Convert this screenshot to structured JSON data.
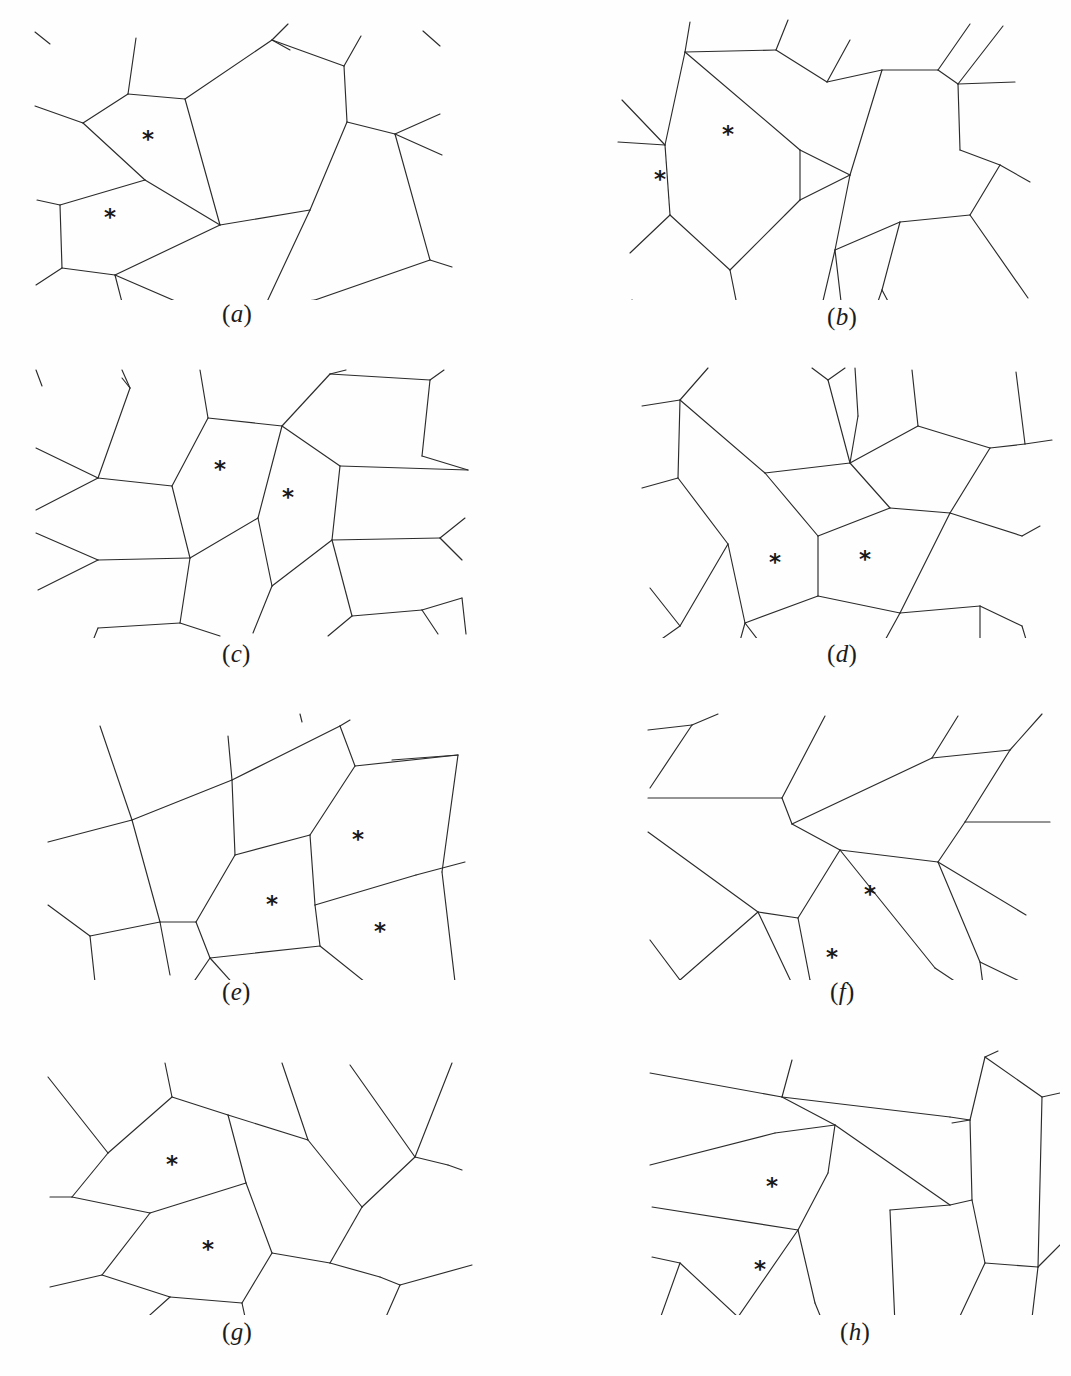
{
  "figure": {
    "type": "scientific-figure",
    "background_color": "#fefefe",
    "line_color": "#2b2b2b",
    "marker_glyph": "*",
    "marker_name": "asterisk-cell-marker",
    "panel_count": 8,
    "columns": 2,
    "rows": 4
  },
  "panels": [
    {
      "id": "a",
      "label": "(a)",
      "label_left": 222,
      "label_top": 300,
      "origin_x": 10,
      "origin_y": 10,
      "width": 500,
      "height": 290,
      "marker_count": 2,
      "markers": [
        {
          "x": 138,
          "y": 130
        },
        {
          "x": 100,
          "y": 208
        }
      ],
      "edges": [
        "M 25 22 L 40 34",
        "M 126 28 L 118 84",
        "M 118 84 L 73 113",
        "M 73 113 L 25 96",
        "M 118 84 L 175 89",
        "M 175 89 L 262 30",
        "M 262 30 L 278 14",
        "M 262 30 L 280 40",
        "M 262 30 L 334 56",
        "M 334 56 L 351 26",
        "M 334 56 L 337 112",
        "M 337 112 L 385 124",
        "M 385 124 L 430 104",
        "M 385 124 L 432 145",
        "M 385 124 L 420 250",
        "M 175 89 L 210 215",
        "M 210 215 L 300 200",
        "M 300 200 L 337 112",
        "M 210 215 L 135 170",
        "M 135 170 L 73 113",
        "M 135 170 L 50 195",
        "M 50 195 L 27 190",
        "M 50 195 L 52 258",
        "M 52 258 L 26 275",
        "M 52 258 L 105 265",
        "M 105 265 L 114 300",
        "M 105 265 L 186 300",
        "M 105 265 L 210 215",
        "M 300 200 L 255 296",
        "M 255 296 L 230 300",
        "M 255 296 L 305 290",
        "M 305 290 L 420 250",
        "M 420 250 L 442 257",
        "M 413 21 L 430 36"
      ]
    },
    {
      "id": "b",
      "label": "(b)",
      "label_left": 827,
      "label_top": 303,
      "origin_x": 560,
      "origin_y": 10,
      "width": 500,
      "height": 290,
      "marker_count": 2,
      "markers": [
        {
          "x": 168,
          "y": 125
        },
        {
          "x": 100,
          "y": 170
        }
      ],
      "edges": [
        "M 130 12 L 125 42",
        "M 125 42 L 216 40",
        "M 216 40 L 228 10",
        "M 216 40 L 267 72",
        "M 267 72 L 290 30",
        "M 267 72 L 322 60",
        "M 322 60 L 378 60",
        "M 378 60 L 410 14",
        "M 378 60 L 398 74",
        "M 398 74 L 443 16",
        "M 398 74 L 455 72",
        "M 398 74 L 400 140",
        "M 400 140 L 440 155",
        "M 440 155 L 470 172",
        "M 440 155 L 410 205",
        "M 322 60 L 290 165",
        "M 290 165 L 240 140",
        "M 290 165 L 275 240",
        "M 275 240 L 262 295",
        "M 275 240 L 282 300",
        "M 275 240 L 340 212",
        "M 340 212 L 410 205",
        "M 340 212 L 322 280",
        "M 322 280 L 315 300",
        "M 322 280 L 330 295",
        "M 410 205 L 468 288",
        "M 125 42 L 105 135",
        "M 105 135 L 62 90",
        "M 105 135 L 58 132",
        "M 105 135 L 110 205",
        "M 110 205 L 70 243",
        "M 110 205 L 170 260",
        "M 170 260 L 178 300",
        "M 170 260 L 240 190",
        "M 240 190 L 240 140",
        "M 240 140 L 125 42",
        "M 240 190 L 290 165",
        "M 72 290 L 82 300"
      ]
    },
    {
      "id": "c",
      "label": "(c)",
      "label_left": 222,
      "label_top": 640,
      "origin_x": 10,
      "origin_y": 358,
      "width": 500,
      "height": 280,
      "marker_count": 2,
      "markers": [
        {
          "x": 210,
          "y": 112
        },
        {
          "x": 278,
          "y": 140
        }
      ],
      "edges": [
        "M 26 12 L 32 28",
        "M 112 12 L 120 30",
        "M 120 30 L 112 20",
        "M 120 30 L 88 120",
        "M 88 120 L 26 90",
        "M 88 120 L 26 152",
        "M 88 120 L 162 128",
        "M 162 128 L 198 60",
        "M 198 60 L 190 12",
        "M 198 60 L 272 68",
        "M 272 68 L 320 16",
        "M 320 16 L 336 12",
        "M 320 16 L 420 22",
        "M 420 22 L 434 12",
        "M 420 22 L 412 98",
        "M 412 98 L 458 112",
        "M 458 112 L 330 108",
        "M 330 108 L 272 68",
        "M 330 108 L 322 182",
        "M 322 182 L 430 180",
        "M 430 180 L 455 160",
        "M 430 180 L 452 202",
        "M 322 182 L 342 258",
        "M 342 258 L 318 278",
        "M 342 258 L 412 252",
        "M 412 252 L 428 276",
        "M 412 252 L 452 240",
        "M 452 240 L 456 276",
        "M 162 128 L 180 200",
        "M 180 200 L 88 202",
        "M 88 202 L 26 175",
        "M 88 202 L 28 232",
        "M 180 200 L 248 160",
        "M 248 160 L 272 68",
        "M 248 160 L 262 228",
        "M 262 228 L 243 275",
        "M 262 228 L 322 182",
        "M 180 200 L 170 265",
        "M 170 265 L 88 270",
        "M 170 265 L 210 278",
        "M 88 270 L 84 280"
      ]
    },
    {
      "id": "d",
      "label": "(d)",
      "label_left": 827,
      "label_top": 640,
      "origin_x": 560,
      "origin_y": 358,
      "width": 500,
      "height": 280,
      "marker_count": 2,
      "markers": [
        {
          "x": 215,
          "y": 205
        },
        {
          "x": 305,
          "y": 202
        }
      ],
      "edges": [
        "M 120 42 L 148 10",
        "M 120 42 L 82 48",
        "M 120 42 L 118 120",
        "M 118 120 L 82 130",
        "M 118 120 L 168 186",
        "M 168 186 L 120 268",
        "M 120 268 L 96 285",
        "M 96 285 L 100 300",
        "M 120 268 L 90 230",
        "M 168 186 L 185 265",
        "M 185 265 L 178 290",
        "M 185 265 L 208 295",
        "M 185 265 L 258 238",
        "M 258 238 L 258 178",
        "M 258 178 L 205 115",
        "M 205 115 L 120 42",
        "M 205 115 L 290 105",
        "M 290 105 L 268 22",
        "M 268 22 L 252 10",
        "M 268 22 L 285 10",
        "M 290 105 L 298 58",
        "M 298 58 L 295 10",
        "M 290 105 L 330 150",
        "M 330 150 L 258 178",
        "M 258 238 L 340 255",
        "M 340 255 L 318 295",
        "M 340 255 L 420 248",
        "M 420 248 L 420 292",
        "M 420 248 L 462 268",
        "M 462 268 L 468 288",
        "M 340 255 L 390 155",
        "M 390 155 L 330 150",
        "M 390 155 L 462 178",
        "M 462 178 L 480 168",
        "M 390 155 L 430 90",
        "M 430 90 L 465 86",
        "M 465 86 L 492 82",
        "M 465 86 L 456 14",
        "M 430 90 L 358 68",
        "M 358 68 L 352 12",
        "M 358 68 L 290 105"
      ]
    },
    {
      "id": "e",
      "label": "(e)",
      "label_left": 222,
      "label_top": 978,
      "origin_x": 10,
      "origin_y": 700,
      "width": 500,
      "height": 280,
      "marker_count": 3,
      "markers": [
        {
          "x": 262,
          "y": 205
        },
        {
          "x": 348,
          "y": 140
        },
        {
          "x": 370,
          "y": 232
        }
      ],
      "edges": [
        "M 90 26 L 122 120",
        "M 122 120 L 150 222",
        "M 150 222 L 160 275",
        "M 122 120 L 38 142",
        "M 122 120 L 222 80",
        "M 222 80 L 218 36",
        "M 222 80 L 225 155",
        "M 222 80 L 330 26",
        "M 292 22 L 290 14",
        "M 330 26 L 340 20",
        "M 330 26 L 345 66",
        "M 345 66 L 448 55",
        "M 448 55 L 382 60",
        "M 448 55 L 432 172",
        "M 432 172 L 445 282",
        "M 345 66 L 300 135",
        "M 300 135 L 305 205",
        "M 305 205 L 310 246",
        "M 305 205 L 406 175",
        "M 406 175 L 455 162",
        "M 300 135 L 225 155",
        "M 225 155 L 186 222",
        "M 186 222 L 150 222",
        "M 150 222 L 80 236",
        "M 80 236 L 38 205",
        "M 80 236 L 88 310",
        "M 186 222 L 200 258",
        "M 200 258 L 170 302",
        "M 200 258 L 245 308",
        "M 200 258 L 310 246",
        "M 310 246 L 365 290",
        "M 365 290 L 448 282",
        "M 365 290 L 360 300"
      ]
    },
    {
      "id": "f",
      "label": "(f)",
      "label_left": 830,
      "label_top": 978,
      "origin_x": 560,
      "origin_y": 700,
      "width": 500,
      "height": 280,
      "marker_count": 2,
      "markers": [
        {
          "x": 310,
          "y": 195
        },
        {
          "x": 272,
          "y": 258
        }
      ],
      "edges": [
        "M 88 30 L 132 25",
        "M 132 25 L 90 88",
        "M 132 25 L 158 14",
        "M 88 98 L 222 98",
        "M 222 98 L 265 16",
        "M 222 98 L 232 124",
        "M 232 124 L 280 150",
        "M 232 124 L 372 58",
        "M 372 58 L 398 16",
        "M 372 58 L 450 50",
        "M 450 50 L 482 14",
        "M 450 50 L 405 122",
        "M 405 122 L 490 122",
        "M 405 122 L 378 162",
        "M 378 162 L 466 215",
        "M 378 162 L 280 150",
        "M 280 150 L 238 218",
        "M 238 218 L 198 212",
        "M 198 212 L 88 132",
        "M 238 218 L 250 280",
        "M 250 280 L 243 300",
        "M 198 212 L 235 290",
        "M 235 290 L 240 300",
        "M 198 212 L 120 280",
        "M 120 280 L 90 240",
        "M 120 280 L 95 298",
        "M 280 150 L 375 268",
        "M 375 268 L 420 298",
        "M 378 162 L 420 262",
        "M 420 262 L 425 300",
        "M 420 262 L 478 290"
      ]
    },
    {
      "id": "g",
      "label": "(g)",
      "label_left": 222,
      "label_top": 1318,
      "origin_x": 10,
      "origin_y": 1035,
      "width": 500,
      "height": 280,
      "marker_count": 2,
      "markers": [
        {
          "x": 162,
          "y": 130
        },
        {
          "x": 198,
          "y": 215
        }
      ],
      "edges": [
        "M 155 28 L 162 62",
        "M 162 62 L 98 118",
        "M 98 118 L 38 42",
        "M 98 118 L 62 162",
        "M 62 162 L 40 162",
        "M 62 162 L 140 178",
        "M 140 178 L 92 240",
        "M 92 240 L 40 252",
        "M 92 240 L 160 262",
        "M 160 262 L 112 305",
        "M 160 262 L 232 268",
        "M 232 268 L 240 305",
        "M 232 268 L 262 218",
        "M 262 218 L 236 148",
        "M 236 148 L 218 80",
        "M 218 80 L 162 62",
        "M 236 148 L 140 178",
        "M 218 80 L 298 105",
        "M 298 105 L 272 28",
        "M 298 105 L 352 172",
        "M 352 172 L 320 228",
        "M 320 228 L 262 218",
        "M 320 228 L 370 242",
        "M 370 242 L 390 250",
        "M 390 250 L 462 230",
        "M 390 250 L 368 300",
        "M 368 300 L 330 308",
        "M 368 300 L 345 312",
        "M 352 172 L 405 122",
        "M 405 122 L 340 30",
        "M 405 122 L 438 130",
        "M 438 130 L 452 135",
        "M 405 122 L 442 28"
      ]
    },
    {
      "id": "h",
      "label": "(h)",
      "label_left": 840,
      "label_top": 1318,
      "origin_x": 560,
      "origin_y": 1035,
      "width": 500,
      "height": 280,
      "marker_count": 2,
      "markers": [
        {
          "x": 212,
          "y": 152
        },
        {
          "x": 200,
          "y": 235
        }
      ],
      "edges": [
        "M 90 38 L 222 62",
        "M 222 62 L 232 25",
        "M 222 62 L 275 90",
        "M 275 90 L 215 98",
        "M 215 98 L 90 130",
        "M 275 90 L 390 170",
        "M 390 170 L 330 175",
        "M 330 175 L 335 290",
        "M 335 290 L 330 308",
        "M 390 170 L 412 165",
        "M 412 165 L 410 85",
        "M 410 85 L 392 88",
        "M 222 62 L 390 82",
        "M 390 82 L 410 85",
        "M 410 85 L 425 22",
        "M 425 22 L 438 16",
        "M 425 22 L 482 62",
        "M 482 62 L 500 58",
        "M 482 62 L 478 232",
        "M 478 232 L 470 300",
        "M 412 165 L 425 228",
        "M 425 228 L 478 232",
        "M 425 228 L 392 298",
        "M 478 232 L 500 210",
        "M 275 90 L 268 138",
        "M 268 138 L 238 195",
        "M 238 195 L 92 172",
        "M 238 195 L 255 268",
        "M 255 268 L 268 300",
        "M 238 195 L 178 282",
        "M 178 282 L 180 305",
        "M 178 282 L 120 228",
        "M 120 228 L 96 295",
        "M 120 228 L 92 222"
      ]
    }
  ]
}
